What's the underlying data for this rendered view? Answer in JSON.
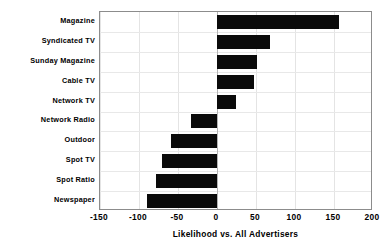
{
  "chart_data": {
    "type": "bar",
    "orientation": "horizontal",
    "title": "",
    "xlabel": "Likelihood vs. All Advertisers",
    "ylabel": "",
    "categories": [
      "Magazine",
      "Syndicated TV",
      "Sunday Magazine",
      "Cable TV",
      "Network TV",
      "Network Radio",
      "Outdoor",
      "Spot TV",
      "Spot Ratio",
      "Newspaper"
    ],
    "values": [
      156,
      68,
      51,
      48,
      24,
      -33,
      -59,
      -70,
      -78,
      -90
    ],
    "xlim": [
      -150,
      200
    ],
    "xticks": [
      -150,
      -100,
      -50,
      0,
      50,
      100,
      150,
      200
    ],
    "xtick_labels": [
      "-150",
      "-100",
      "-50",
      "0",
      "50",
      "100",
      "150",
      "200"
    ],
    "grid": true,
    "legend": false,
    "bar_color": "#0a0a0a",
    "background_color": "#ffffff",
    "gridline_color": "#e4e4e4",
    "axis_color": "#8c8c8c",
    "zero_line_color": "#b4b4b4"
  }
}
